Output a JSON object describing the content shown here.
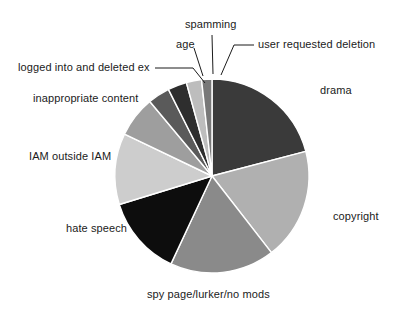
{
  "chart_data": {
    "type": "pie",
    "title": "",
    "subtitle": "",
    "xlabel": "",
    "ylabel": "",
    "legend_position": "none",
    "grid": false,
    "labels_outside": true,
    "start_angle_deg": 0,
    "direction": "clockwise",
    "categories": [
      "drama",
      "copyright",
      "spy page/lurker/no mods",
      "hate speech",
      "IAM outside IAM",
      "inappropriate content",
      "logged into and deleted ex",
      "age",
      "spamming",
      "user requested deletion"
    ],
    "values": [
      20.6,
      18.3,
      17.2,
      13.1,
      11.7,
      6.7,
      3.6,
      3.1,
      2.5,
      1.7
    ],
    "angles_deg": [
      74.2,
      65.9,
      61.9,
      47.2,
      42.1,
      24.1,
      13.0,
      11.2,
      9.0,
      6.1
    ],
    "colors": [
      "#3a3a3a",
      "#b0b0b0",
      "#8a8a8a",
      "#0d0d0d",
      "#cdcdcd",
      "#9e9e9e",
      "#5a5a5a",
      "#2e2e2e",
      "#bdbdbd",
      "#787878"
    ],
    "slice_border_color": "#ffffff",
    "background_color": "#ffffff",
    "text_color": "#1b1b1b"
  },
  "labels": {
    "drama": "drama",
    "copyright": "copyright",
    "spy_page": "spy page/lurker/no mods",
    "hate_speech": "hate speech",
    "iam_outside_iam": "IAM outside IAM",
    "inappropriate_content": "inappropriate content",
    "logged_into": "logged into and deleted ex",
    "age": "age",
    "spamming": "spamming",
    "user_requested_deletion": "user requested deletion"
  }
}
